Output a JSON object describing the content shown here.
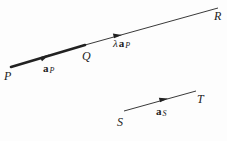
{
  "diagram": {
    "points": {
      "P": {
        "label": "P",
        "x": 5,
        "y": 79
      },
      "Q": {
        "label": "Q",
        "x": 82,
        "y": 59
      },
      "R": {
        "label": "R",
        "x": 215,
        "y": 20
      },
      "S": {
        "label": "S",
        "x": 117,
        "y": 125
      },
      "T": {
        "label": "T",
        "x": 197,
        "y": 102
      }
    },
    "vectors": {
      "aP": {
        "symbol": "a",
        "subscript": "P",
        "x": 43,
        "y": 73
      },
      "lambda_aP": {
        "prefix": "λ",
        "symbol": "a",
        "subscript": "P",
        "x": 113,
        "y": 47
      },
      "aS": {
        "symbol": "a",
        "subscript": "S",
        "x": 156,
        "y": 116
      }
    },
    "lines": {
      "PQ": {
        "x1": 11,
        "y1": 67,
        "x2": 85,
        "y2": 45,
        "weight": "thick"
      },
      "QR": {
        "x1": 85,
        "y1": 45,
        "x2": 218,
        "y2": 8,
        "weight": "thin"
      },
      "ST": {
        "x1": 124,
        "y1": 111,
        "x2": 196,
        "y2": 91,
        "weight": "thin"
      }
    },
    "colors": {
      "ink": "#222222",
      "background": "#fdfdfd"
    }
  }
}
